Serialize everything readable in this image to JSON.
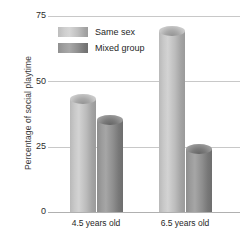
{
  "chart_data": {
    "type": "bar",
    "title": "",
    "xlabel": "",
    "ylabel": "Percentage of social playtime",
    "categories": [
      "4.5 years old",
      "6.5 years old"
    ],
    "series": [
      {
        "name": "Same sex",
        "values": [
          45,
          71
        ],
        "color": "#c6c6c6"
      },
      {
        "name": "Mixed group",
        "values": [
          37,
          26
        ],
        "color": "#8c8c8c"
      }
    ],
    "ylim": [
      0,
      75
    ],
    "yticks": [
      0,
      25,
      50,
      75
    ],
    "ytick_labels": [
      "0",
      "25",
      "50",
      "75"
    ],
    "grid": true,
    "legend_position": "upper-left-inside"
  },
  "axis": {
    "y_title": "Percentage of social playtime",
    "ticks": [
      {
        "label": "75",
        "value": 75
      },
      {
        "label": "50",
        "value": 50
      },
      {
        "label": "25",
        "value": 25
      },
      {
        "label": "0",
        "value": 0
      }
    ]
  },
  "legend": {
    "items": [
      {
        "label": "Same sex",
        "swatch": "light"
      },
      {
        "label": "Mixed group",
        "swatch": "dark"
      }
    ]
  },
  "categories": [
    {
      "label": "4.5 years old"
    },
    {
      "label": "6.5 years old"
    }
  ]
}
